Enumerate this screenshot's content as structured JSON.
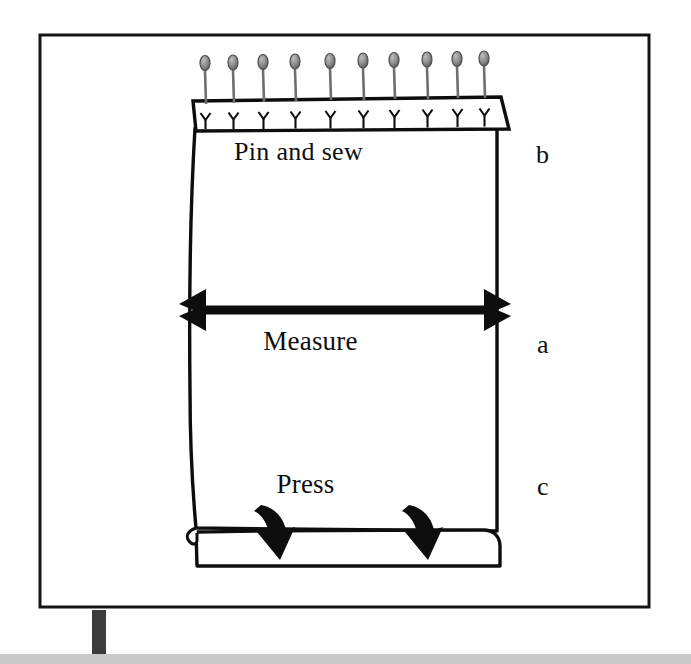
{
  "figure": {
    "type": "instructional-sewing-diagram",
    "background_color": "#ffffff",
    "ink_color": "#0d0d0d",
    "frame": {
      "name": "outer-frame",
      "stroke_color": "#111111",
      "x": 39,
      "y": 34,
      "width": 611,
      "height": 574
    },
    "fabric": {
      "name": "fabric-panel",
      "outline_color": "#0d0d0d",
      "fill_color": "#ffffff",
      "left": 192,
      "right": 497,
      "top": 103,
      "bottom": 535
    },
    "pin_row": {
      "name": "pin-row",
      "count": 10,
      "pin_head_color": "#8a8a8a",
      "pin_head_outline": "#4a4a4a",
      "pin_stem_color": "#6e6e6e",
      "head_positions_x": [
        205,
        233,
        263,
        295,
        330,
        363,
        394,
        427,
        457,
        484
      ],
      "head_y": 63,
      "band_top": 99,
      "band_bottom": 131
    },
    "measure_arrow": {
      "name": "measure-double-arrow",
      "color": "#0d0d0d",
      "y": 310,
      "x_start": 200,
      "x_end": 490,
      "heads": "both",
      "head_style": "barbed"
    },
    "press_arrows": {
      "name": "press-curved-arrows",
      "color": "#0d0d0d",
      "count": 2,
      "x_positions": [
        272,
        420
      ],
      "direction": "down"
    },
    "hem_fold": {
      "name": "hem-fold",
      "top": 530,
      "bottom": 567,
      "left": 192,
      "right": 500
    },
    "stand": {
      "name": "stand-post",
      "color": "#3c3c3c",
      "x": 92,
      "y": 617,
      "width": 14,
      "height": 38
    },
    "floor_strip": {
      "name": "floor-strip",
      "color": "#c8c8c8",
      "x": 0,
      "y": 654,
      "width": 691,
      "height": 10
    }
  },
  "labels": {
    "pin_and_sew": "Pin and sew",
    "measure": "Measure",
    "press": "Press",
    "part_b": "b",
    "part_a": "a",
    "part_c": "c"
  }
}
